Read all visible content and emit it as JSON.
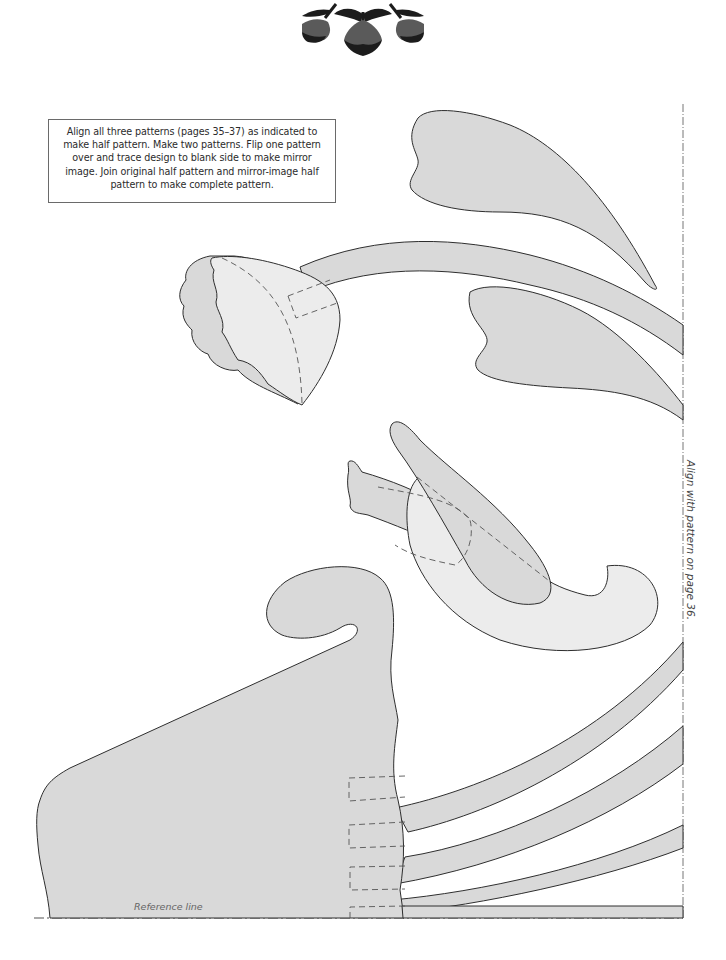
{
  "header_ornament": {
    "icon": "tulip-ornament-icon"
  },
  "instructions": {
    "text": "Align all three patterns (pages 35–37) as indicated to make half pattern. Make two patterns. Flip one pattern over and trace design to blank side to make mirror image. Join original half pattern and mirror-image half pattern to make complete pattern."
  },
  "alignment_label": "Align with pattern on page 36.",
  "reference_line_label": "Reference line",
  "colors": {
    "piece_fill": "#d9d9d9",
    "piece_fill_light": "#ececec",
    "outline": "#2e2e2e",
    "dashed": "#555555",
    "ornament_dark": "#1c1c1c",
    "ornament_mid": "#5a5a5a"
  }
}
